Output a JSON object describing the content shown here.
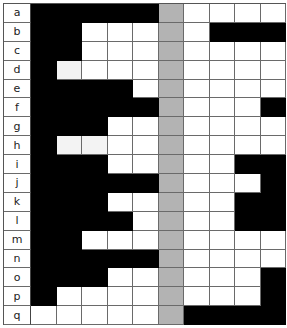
{
  "colors": {
    "filled": "#000000",
    "empty": "#ffffff",
    "separator_column": "#b3b3b3",
    "light_empty": "#f3f3f3"
  },
  "grid": {
    "columns_left": 5,
    "separator_column_index": 6,
    "columns_right": 4,
    "rows": [
      {
        "label": "a",
        "left": [
          1,
          1,
          1,
          1,
          1
        ],
        "right": [
          0,
          0,
          0,
          0
        ]
      },
      {
        "label": "b",
        "left": [
          1,
          1,
          0,
          0,
          0
        ],
        "right": [
          0,
          1,
          1,
          1
        ]
      },
      {
        "label": "c",
        "left": [
          1,
          1,
          0,
          0,
          0
        ],
        "right": [
          0,
          0,
          0,
          0
        ]
      },
      {
        "label": "d",
        "left": [
          1,
          0,
          0,
          0,
          0
        ],
        "right": [
          0,
          0,
          0,
          0
        ],
        "light": [
          1
        ]
      },
      {
        "label": "e",
        "left": [
          1,
          1,
          1,
          1,
          0
        ],
        "right": [
          0,
          0,
          0,
          0
        ]
      },
      {
        "label": "f",
        "left": [
          1,
          1,
          1,
          1,
          1
        ],
        "right": [
          0,
          0,
          0,
          1
        ]
      },
      {
        "label": "g",
        "left": [
          1,
          1,
          1,
          0,
          0
        ],
        "right": [
          0,
          0,
          0,
          0
        ]
      },
      {
        "label": "h",
        "left": [
          1,
          0,
          0,
          0,
          0
        ],
        "right": [
          0,
          0,
          0,
          0
        ],
        "light": [
          1,
          2
        ]
      },
      {
        "label": "i",
        "left": [
          1,
          1,
          1,
          0,
          0
        ],
        "right": [
          0,
          0,
          1,
          1
        ]
      },
      {
        "label": "j",
        "left": [
          1,
          1,
          1,
          1,
          1
        ],
        "right": [
          0,
          0,
          0,
          1
        ]
      },
      {
        "label": "k",
        "left": [
          1,
          1,
          1,
          0,
          0
        ],
        "right": [
          0,
          0,
          1,
          1
        ]
      },
      {
        "label": "l",
        "left": [
          1,
          1,
          1,
          1,
          0
        ],
        "right": [
          0,
          0,
          1,
          1
        ]
      },
      {
        "label": "m",
        "left": [
          1,
          1,
          0,
          0,
          0
        ],
        "right": [
          0,
          0,
          0,
          0
        ]
      },
      {
        "label": "n",
        "left": [
          1,
          1,
          1,
          1,
          1
        ],
        "right": [
          0,
          0,
          0,
          0
        ]
      },
      {
        "label": "o",
        "left": [
          1,
          1,
          1,
          0,
          0
        ],
        "right": [
          0,
          0,
          0,
          1
        ]
      },
      {
        "label": "p",
        "left": [
          1,
          0,
          0,
          0,
          0
        ],
        "right": [
          0,
          0,
          0,
          1
        ]
      },
      {
        "label": "q",
        "left": [
          0,
          0,
          0,
          0,
          0
        ],
        "right": [
          1,
          1,
          1,
          1
        ]
      }
    ]
  }
}
